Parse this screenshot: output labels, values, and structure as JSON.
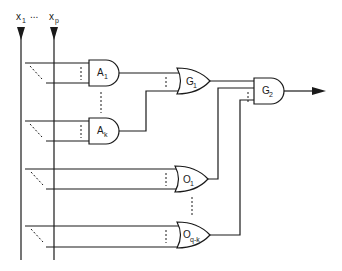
{
  "diagram": {
    "type": "logic-circuit",
    "inputs": {
      "first": {
        "base": "x",
        "sub": "1"
      },
      "ellipsis": "...",
      "last": {
        "base": "x",
        "sub": "p"
      }
    },
    "and_gates": [
      {
        "base": "A",
        "sub": "1"
      },
      {
        "base": "A",
        "sub": "k"
      }
    ],
    "or_gates": [
      {
        "base": "O",
        "sub": "1"
      },
      {
        "base": "O",
        "sub": "q-k"
      }
    ],
    "combiner_or": {
      "base": "G",
      "sub": "1"
    },
    "output_and": {
      "base": "G",
      "sub": "2"
    },
    "colors": {
      "stroke": "#1a1a1a",
      "background": "#ffffff"
    }
  }
}
